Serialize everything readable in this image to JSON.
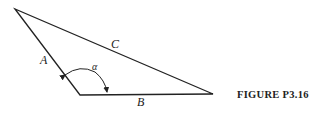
{
  "figure": {
    "caption": "FIGURE P3.16",
    "labels": {
      "A": "A",
      "B": "B",
      "C": "C",
      "alpha": "α"
    },
    "vertices": {
      "top_left": [
        15,
        9
      ],
      "bottom_left": [
        80,
        95
      ],
      "bottom_right": [
        213,
        94
      ]
    },
    "colors": {
      "line": "#222222"
    }
  }
}
